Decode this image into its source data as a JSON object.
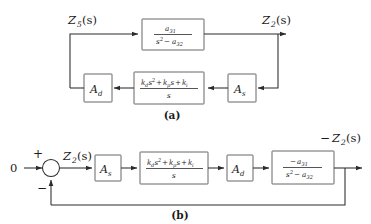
{
  "figure": {
    "type": "control-block-diagram",
    "background": "#ffffff",
    "line_color": "#2b2b2b",
    "block_border_color": "#555555",
    "subfigures": [
      {
        "id": "a",
        "caption": "(a)",
        "description": "closed-loop plant with feedback path through A_s, PID controller and A_d"
      },
      {
        "id": "b",
        "caption": "(b)",
        "description": "equivalent unity-feedback forward-path arrangement driven by zero reference"
      }
    ]
  },
  "diagram_a": {
    "input_label": {
      "Z": "Z",
      "sub": "5",
      "arg": "(s)"
    },
    "output_label": {
      "Z": "Z",
      "sub": "2",
      "arg": "(s)"
    },
    "plant_block": {
      "name": "plant-transfer-function",
      "numerator": {
        "a": "a",
        "sub": "31"
      },
      "denominator": {
        "s": "s",
        "sup": "2",
        "minus": "−",
        "a": "a",
        "sub": "32"
      },
      "numerator_text": "a31",
      "denominator_text": "s2 - a32"
    },
    "controller_block": {
      "name": "pid-controller",
      "numerator_terms": [
        {
          "k": "k",
          "sub": "d",
          "var": "s",
          "sup": "2"
        },
        {
          "op": "+",
          "k": "k",
          "sub": "p",
          "var": "s"
        },
        {
          "op": "+",
          "k": "k",
          "sub": "i"
        }
      ],
      "denominator": "s",
      "numerator_text": "kd s2 + kp s + ki",
      "denominator_text": "s"
    },
    "gain_left": {
      "name": "gain-ad",
      "A": "A",
      "sub": "d"
    },
    "gain_right": {
      "name": "gain-as",
      "A": "A",
      "sub": "s"
    },
    "caption": "(a)"
  },
  "diagram_b": {
    "reference_input": "0",
    "sum_plus": "+",
    "sum_minus": "−",
    "error_label": {
      "Z": "Z",
      "sub": "2",
      "arg": "(s)"
    },
    "output_sign": "−",
    "output_label": {
      "Z": "Z",
      "sub": "2",
      "arg": "(s)"
    },
    "gain_first": {
      "name": "gain-as",
      "A": "A",
      "sub": "s"
    },
    "controller_block": {
      "name": "pid-controller",
      "numerator_text": "kd s2 + kp s + ki",
      "denominator_text": "s"
    },
    "gain_second": {
      "name": "gain-ad",
      "A": "A",
      "sub": "d"
    },
    "plant_block": {
      "name": "plant-transfer-function",
      "lead_minus": "−",
      "numerator": {
        "a": "a",
        "sub": "31"
      },
      "denominator": {
        "s": "s",
        "sup": "2",
        "minus": "−",
        "a": "a",
        "sub": "32"
      },
      "numerator_text": "-a31",
      "denominator_text": "s2 - a32"
    },
    "caption": "(b)"
  }
}
